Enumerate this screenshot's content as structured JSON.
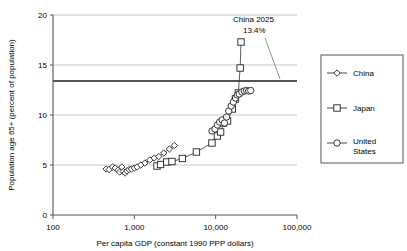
{
  "chart_data": {
    "type": "scatter",
    "title": "",
    "xlabel": "Per capita GDP (constant 1990 PPP dollars)",
    "ylabel": "Population age 65+ (percent of population)",
    "xscale": "log",
    "xlim": [
      100,
      100000
    ],
    "ylim": [
      0,
      20
    ],
    "xticks": [
      100,
      1000,
      10000,
      100000
    ],
    "xticklabels": [
      "100",
      "1,000",
      "10,000",
      "100,000"
    ],
    "yticks": [
      0,
      5,
      10,
      15,
      20
    ],
    "yticklabels": [
      "0",
      "5",
      "10",
      "15",
      "20"
    ],
    "grid": "horizontal",
    "legend_position": "right-outside",
    "annotations": [
      {
        "name": "china-2025-annotation",
        "line1": "China 2025",
        "line2": "13.4%",
        "value": 13.4,
        "reference_line_y": 13.4
      }
    ],
    "reference_lines": [
      {
        "name": "china-2025-reference-line",
        "y": 13.4,
        "color": "#555555",
        "width": 1.8
      }
    ],
    "series": [
      {
        "name": "China",
        "marker": "diamond",
        "color": "#333333",
        "points": [
          [
            450,
            4.6
          ],
          [
            490,
            4.55
          ],
          [
            540,
            4.8
          ],
          [
            580,
            4.7
          ],
          [
            630,
            4.5
          ],
          [
            660,
            4.3
          ],
          [
            700,
            4.8
          ],
          [
            730,
            4.35
          ],
          [
            770,
            4.2
          ],
          [
            810,
            4.4
          ],
          [
            860,
            4.55
          ],
          [
            920,
            4.6
          ],
          [
            1000,
            4.7
          ],
          [
            1080,
            4.8
          ],
          [
            1200,
            5.0
          ],
          [
            1350,
            5.2
          ],
          [
            1550,
            5.5
          ],
          [
            1750,
            5.7
          ],
          [
            2000,
            5.85
          ],
          [
            2300,
            6.2
          ],
          [
            2700,
            6.6
          ],
          [
            3100,
            6.95
          ]
        ]
      },
      {
        "name": "Japan",
        "marker": "square",
        "color": "#333333",
        "points": [
          [
            1900,
            4.9
          ],
          [
            2100,
            5.05
          ],
          [
            2500,
            5.3
          ],
          [
            2900,
            5.35
          ],
          [
            3900,
            5.65
          ],
          [
            5800,
            6.3
          ],
          [
            9000,
            7.2
          ],
          [
            10500,
            7.9
          ],
          [
            11500,
            8.3
          ],
          [
            12500,
            9.2
          ],
          [
            14000,
            9.4
          ],
          [
            16000,
            10.6
          ],
          [
            17500,
            11.6
          ],
          [
            19000,
            12.2
          ],
          [
            20000,
            14.7
          ],
          [
            20500,
            17.3
          ]
        ]
      },
      {
        "name": "United States",
        "marker": "circle",
        "color": "#333333",
        "points": [
          [
            9000,
            8.4
          ],
          [
            9800,
            8.6
          ],
          [
            10500,
            9.0
          ],
          [
            11200,
            9.3
          ],
          [
            12000,
            9.5
          ],
          [
            12800,
            9.2
          ],
          [
            13600,
            9.8
          ],
          [
            14500,
            10.4
          ],
          [
            15500,
            10.9
          ],
          [
            16500,
            11.3
          ],
          [
            17500,
            11.7
          ],
          [
            18500,
            12.0
          ],
          [
            19500,
            12.1
          ],
          [
            21000,
            12.3
          ],
          [
            22500,
            12.4
          ],
          [
            24000,
            12.45
          ],
          [
            25500,
            12.4
          ],
          [
            27000,
            12.45
          ]
        ]
      }
    ]
  },
  "legend": {
    "items": [
      {
        "label": "China",
        "marker": "diamond"
      },
      {
        "label": "Japan",
        "marker": "square"
      },
      {
        "label": "United States",
        "marker": "circle",
        "label_line1": "United",
        "label_line2": "States"
      }
    ]
  }
}
